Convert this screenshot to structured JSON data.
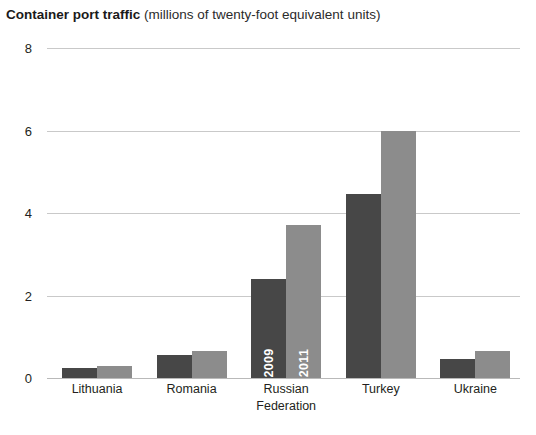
{
  "title": {
    "main": "Container port traffic",
    "sub": "(millions of twenty-foot equivalent units)"
  },
  "chart_data": {
    "type": "bar",
    "title": "Container port traffic (millions of twenty-foot equivalent units)",
    "xlabel": "",
    "ylabel": "millions of twenty-foot equivalent units",
    "ylim": [
      0,
      8
    ],
    "yticks": [
      "0",
      "2",
      "4",
      "6",
      "8"
    ],
    "ytick_values": [
      0,
      2,
      4,
      6,
      8
    ],
    "grid": true,
    "legend": "in-bar labels on Russian Federation bars",
    "categories": [
      "Lithuania",
      "Romania",
      "Russian Federation",
      "Turkey",
      "Ukraine"
    ],
    "category_lines": [
      [
        "Lithuania"
      ],
      [
        "Romania"
      ],
      [
        "Russian",
        "Federation"
      ],
      [
        "Turkey"
      ],
      [
        "Ukraine"
      ]
    ],
    "series": [
      {
        "name": "2009",
        "color": "#474747",
        "values": [
          0.25,
          0.57,
          2.4,
          4.45,
          0.45
        ]
      },
      {
        "name": "2011",
        "color": "#8c8c8c",
        "values": [
          0.3,
          0.65,
          3.7,
          6.0,
          0.65
        ]
      }
    ],
    "annotations": [
      {
        "text": "2009",
        "bar": "Russian Federation / 2009",
        "orientation": "vertical"
      },
      {
        "text": "2011",
        "bar": "Russian Federation / 2011",
        "orientation": "vertical"
      }
    ]
  }
}
